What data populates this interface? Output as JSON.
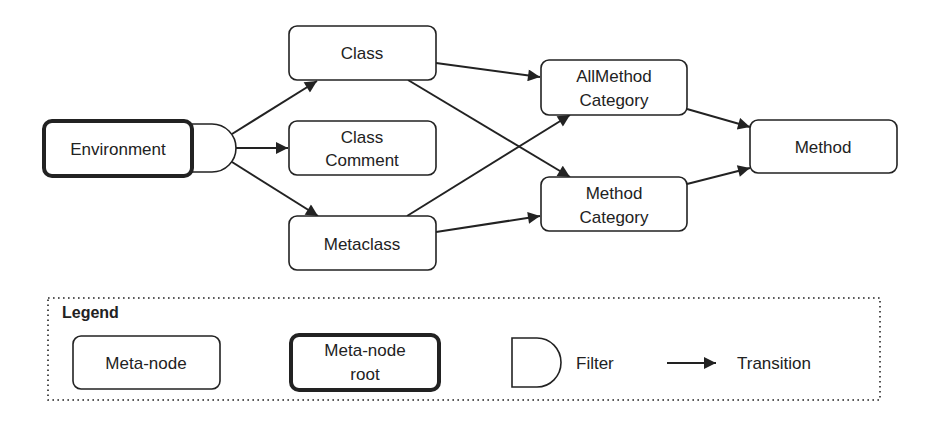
{
  "diagram": {
    "nodes": {
      "environment": {
        "lines": [
          "Environment"
        ],
        "kind": "meta-node-root"
      },
      "filter": {
        "kind": "filter"
      },
      "class": {
        "lines": [
          "Class"
        ],
        "kind": "meta-node"
      },
      "class_comment": {
        "lines": [
          "Class",
          "Comment"
        ],
        "kind": "meta-node"
      },
      "metaclass": {
        "lines": [
          "Metaclass"
        ],
        "kind": "meta-node"
      },
      "allmethod_category": {
        "lines": [
          "AllMethod",
          "Category"
        ],
        "kind": "meta-node"
      },
      "method_category": {
        "lines": [
          "Method",
          "Category"
        ],
        "kind": "meta-node"
      },
      "method": {
        "lines": [
          "Method"
        ],
        "kind": "meta-node"
      }
    },
    "edges": [
      {
        "from": "filter",
        "to": "class"
      },
      {
        "from": "filter",
        "to": "class_comment"
      },
      {
        "from": "filter",
        "to": "metaclass"
      },
      {
        "from": "class",
        "to": "allmethod_category"
      },
      {
        "from": "class",
        "to": "method_category"
      },
      {
        "from": "metaclass",
        "to": "allmethod_category"
      },
      {
        "from": "metaclass",
        "to": "method_category"
      },
      {
        "from": "allmethod_category",
        "to": "method"
      },
      {
        "from": "method_category",
        "to": "method"
      }
    ]
  },
  "legend": {
    "title": "Legend",
    "meta_node": {
      "lines": [
        "Meta-node"
      ]
    },
    "meta_node_root": {
      "lines": [
        "Meta-node",
        "root"
      ]
    },
    "filter_label": "Filter",
    "transition_label": "Transition"
  },
  "colors": {
    "stroke": "#222222",
    "background": "#ffffff"
  }
}
